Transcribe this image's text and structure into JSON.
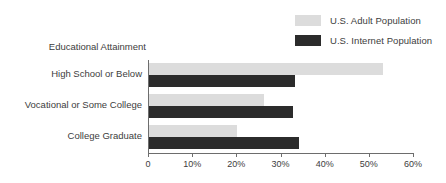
{
  "chart_data": {
    "type": "bar",
    "orientation": "horizontal",
    "title": "",
    "axis_title": "Educational Attainment",
    "categories": [
      "High School or Below",
      "Vocational or Some College",
      "College Graduate"
    ],
    "series": [
      {
        "name": "U.S. Adult Population",
        "color": "#dcdcdc",
        "values": [
          53,
          26,
          20
        ]
      },
      {
        "name": "U.S. Internet Population",
        "color": "#2b2b2b",
        "values": [
          33,
          32.5,
          34
        ]
      }
    ],
    "xlabel": "",
    "ylabel": "",
    "xlim": [
      0,
      60
    ],
    "xticks": [
      0,
      10,
      20,
      30,
      40,
      50,
      60
    ],
    "xtick_labels": [
      "0",
      "10%",
      "20%",
      "30%",
      "40%",
      "50%",
      "60%"
    ],
    "grid": false,
    "legend_position": "top-right"
  },
  "legend": {
    "items": [
      {
        "label": "U.S. Adult Population",
        "color": "#dcdcdc"
      },
      {
        "label": "U.S. Internet Population",
        "color": "#2b2b2b"
      }
    ]
  }
}
